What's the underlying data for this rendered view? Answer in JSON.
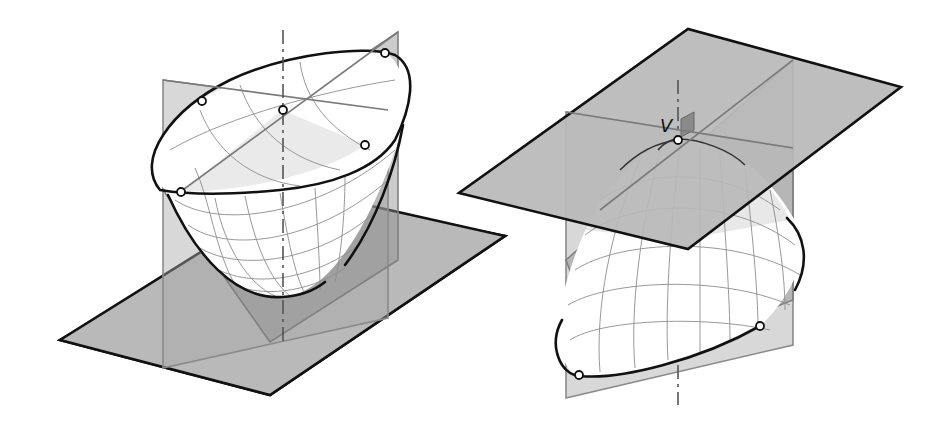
{
  "figure": {
    "left_panel": {
      "description": "Elliptic paraboloid opening upward, with horizontal base plane and two vertical principal planes",
      "points_count": 5,
      "axis_style": "dash-dot"
    },
    "right_panel": {
      "description": "Elliptic paraboloid opening downward, with horizontal tangent plane at vertex and two vertical principal planes",
      "vertex_label": "V",
      "points_count": 3,
      "axis_style": "dash-dot"
    },
    "colors": {
      "plane_fill": "#b9b9b9",
      "outline": "#111111",
      "grid": "#8c8c8c",
      "surface": "#ffffff"
    }
  }
}
